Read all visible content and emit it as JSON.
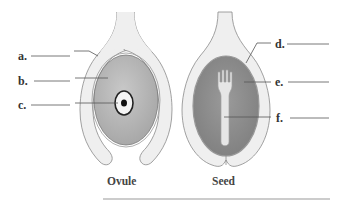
{
  "figure": {
    "captions": {
      "ovule": "Ovule",
      "seed": "Seed"
    },
    "labels": {
      "a": "a.",
      "b": "b.",
      "c": "c.",
      "d": "d.",
      "e": "e.",
      "f": "f."
    },
    "colors": {
      "integument_fill": "#efefef",
      "outline": "#8a8a8a",
      "nucellus_fill": "#b5b5b5",
      "seed_interior_fill": "#8e8e8e",
      "embryo_fill": "#e6e6e6",
      "leader_line": "#555555",
      "baseline": "#9a9a9a"
    }
  }
}
